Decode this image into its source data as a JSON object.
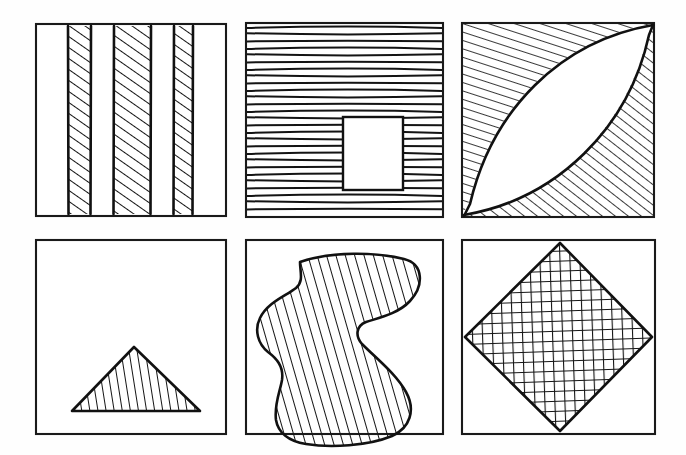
{
  "sheet": {
    "title": "Hand-drawn hatched shapes figure sheet",
    "background_color": "#fefefe",
    "ink_color": "#141414",
    "width": 686,
    "height": 455,
    "rows": 2,
    "columns": 3
  },
  "panels": [
    {
      "id": "panel-1",
      "position": "top-left",
      "label": "vertical-stripes",
      "description": "Square frame containing three vertical bands filled with diagonal hatching",
      "frame": {
        "x": 36,
        "y": 24,
        "width": 190,
        "height": 192
      },
      "fill_pattern": "diagonal-hatch",
      "shape_count": 3,
      "shapes": [
        {
          "name": "stripe-left",
          "x": 68,
          "y": 26,
          "width": 23,
          "height": 188
        },
        {
          "name": "stripe-center",
          "x": 114,
          "y": 26,
          "width": 37,
          "height": 188
        },
        {
          "name": "stripe-right",
          "x": 174,
          "y": 26,
          "width": 19,
          "height": 188
        }
      ]
    },
    {
      "id": "panel-2",
      "position": "top-center",
      "label": "horizontal-lines-with-hole",
      "description": "Square frame filled with horizontal hand-drawn lines and an unfilled rectangular hole",
      "frame": {
        "x": 246,
        "y": 23,
        "width": 197,
        "height": 194
      },
      "fill_pattern": "horizontal-lines",
      "line_spacing": 7,
      "shapes": [
        {
          "name": "inner-rectangle-hole",
          "x": 343,
          "y": 117,
          "width": 60,
          "height": 73
        }
      ]
    },
    {
      "id": "panel-3",
      "position": "top-right",
      "label": "lens-negative-space",
      "description": "Square frame with an unfilled lens shape between two arcs; the two remaining corner regions are diagonally hatched",
      "frame": {
        "x": 462,
        "y": 23,
        "width": 192,
        "height": 194
      },
      "fill_pattern": "diagonal-hatch",
      "shapes": [
        {
          "name": "lens-white-region",
          "orientation": "corner-to-corner"
        },
        {
          "name": "hatched-upper-left-corner-region"
        },
        {
          "name": "hatched-lower-right-corner-region"
        }
      ]
    },
    {
      "id": "panel-4",
      "position": "bottom-left",
      "label": "hatched-triangle",
      "description": "Square frame containing a triangle resting on the lower area, filled with near-vertical hatching",
      "frame": {
        "x": 36,
        "y": 240,
        "width": 190,
        "height": 194
      },
      "fill_pattern": "near-vertical-hatch",
      "shapes": [
        {
          "name": "triangle",
          "apex": [
            134,
            348
          ],
          "base_left": [
            73,
            411
          ],
          "base_right": [
            199,
            411
          ]
        }
      ]
    },
    {
      "id": "panel-5",
      "position": "bottom-center",
      "label": "hatched-blob",
      "description": "Square frame containing an irregular amoeba-like blob filled with steep diagonal hatching",
      "frame": {
        "x": 246,
        "y": 240,
        "width": 197,
        "height": 194
      },
      "fill_pattern": "steep-diagonal-hatch",
      "shapes": [
        {
          "name": "irregular-blob",
          "bounds": {
            "x": 272,
            "y": 253,
            "width": 148,
            "height": 196
          }
        }
      ]
    },
    {
      "id": "panel-6",
      "position": "bottom-right",
      "label": "crosshatched-diamond",
      "description": "Square frame containing an inscribed diamond filled with a dense cross-hatch grid",
      "frame": {
        "x": 462,
        "y": 240,
        "width": 193,
        "height": 194
      },
      "fill_pattern": "cross-hatch-grid",
      "grid_spacing": 10,
      "shapes": [
        {
          "name": "diamond",
          "top": [
            560,
            243
          ],
          "right": [
            652,
            337
          ],
          "bottom": [
            560,
            431
          ],
          "left": [
            465,
            337
          ]
        }
      ]
    }
  ]
}
